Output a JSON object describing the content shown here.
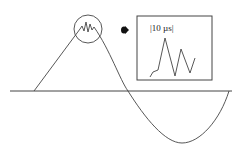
{
  "diagram": {
    "type": "waveform-with-zoom-inset",
    "colors": {
      "stroke": "#444444",
      "background": "#ffffff",
      "dot": "#111111"
    },
    "baseline": {
      "x1": 10,
      "x2": 232,
      "y": 91
    },
    "main_wave": {
      "description": "Triangular rise to a noisy peak, then a sinusoidal fall below baseline and return",
      "points_rise": [
        [
          34,
          91
        ],
        [
          80,
          29
        ]
      ],
      "peak_noise": [
        [
          80,
          29
        ],
        [
          82,
          26
        ],
        [
          84,
          31
        ],
        [
          86,
          22
        ],
        [
          88,
          32
        ],
        [
          90,
          24
        ],
        [
          92,
          30
        ],
        [
          94,
          27
        ]
      ],
      "fall_curve": "M94,27 C110,50 120,80 128,91 C145,118 165,143 182,143 C200,143 220,120 229,91"
    },
    "zoom_circle": {
      "cx": 88,
      "cy": 29,
      "r": 14
    },
    "arrow_marker": {
      "cx": 125,
      "cy": 30,
      "shape": "filled-dot-arrow"
    },
    "inset": {
      "box": {
        "x": 137,
        "y": 16,
        "width": 75,
        "height": 64
      },
      "label": "|10 µs|",
      "trace": [
        [
          150,
          77
        ],
        [
          153,
          72
        ],
        [
          158,
          70
        ],
        [
          165,
          38
        ],
        [
          175,
          76
        ],
        [
          181,
          49
        ],
        [
          190,
          73
        ],
        [
          195,
          58
        ]
      ]
    }
  }
}
